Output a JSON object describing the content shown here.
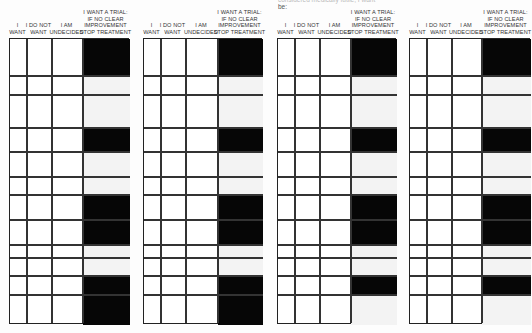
{
  "top_note": {
    "line1": "considered medically futile, I want",
    "line2": "be:"
  },
  "columns": [
    {
      "key": "want",
      "label_lines": [
        "I",
        "WANT"
      ]
    },
    {
      "key": "do_not_want",
      "label_lines": [
        "I DO NOT",
        "WANT"
      ]
    },
    {
      "key": "undecided",
      "label_lines": [
        "I AM",
        "UNDECIDED"
      ]
    },
    {
      "key": "trial",
      "label_lines": [
        "I WANT A TRIAL:",
        "IF NO CLEAR",
        "IMPROVEMENT",
        "STOP TREATMENT"
      ]
    }
  ],
  "row_boundaries_px": [
    38,
    75,
    94,
    127,
    151,
    176,
    194,
    219,
    244,
    257,
    275,
    294,
    324
  ],
  "tables": [
    {
      "id": "table-1",
      "x": [
        9,
        26,
        51,
        82,
        129
      ],
      "trial_column_filled": [
        true,
        false,
        false,
        true,
        false,
        false,
        true,
        true,
        false,
        false,
        true,
        true
      ]
    },
    {
      "id": "table-2",
      "x": [
        143,
        160,
        185,
        217,
        262
      ],
      "trial_column_filled": [
        true,
        false,
        false,
        true,
        false,
        false,
        true,
        true,
        false,
        false,
        true,
        true
      ]
    },
    {
      "id": "table-3",
      "x": [
        277,
        294,
        319,
        350,
        396
      ],
      "trial_column_filled": [
        true,
        false,
        false,
        true,
        false,
        false,
        true,
        true,
        false,
        false,
        true,
        false
      ]
    },
    {
      "id": "table-4",
      "x": [
        409,
        426,
        451,
        481,
        530
      ],
      "trial_column_filled": [
        true,
        false,
        false,
        true,
        false,
        false,
        true,
        true,
        false,
        false,
        true,
        false
      ]
    }
  ],
  "colors": {
    "filled": "#060606",
    "line": "#333333",
    "paper": "#fdfdfd"
  }
}
